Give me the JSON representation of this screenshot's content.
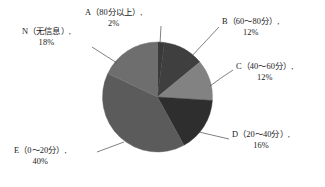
{
  "chart_data": {
    "type": "pie",
    "title": "",
    "subtitle": "",
    "xlabel": "",
    "ylabel": "",
    "legend_position": "none",
    "grid": false,
    "labels_outside": true,
    "leader_lines": true,
    "categories": [
      "A（80分以上）",
      "B（60～80分）",
      "C（40～60分）",
      "D（20～40分）",
      "E（0～20分）",
      "N（无信息）"
    ],
    "values": [
      2,
      12,
      12,
      16,
      40,
      18
    ],
    "value_unit": "%",
    "slices": [
      {
        "key": "A",
        "category": "A（80分以上）",
        "percent_text": "2%",
        "value": 2,
        "color": "#3a3a3a",
        "start_angle_deg": 0,
        "end_angle_deg": 7.2
      },
      {
        "key": "B",
        "category": "B（60～80分）",
        "percent_text": "12%",
        "value": 12,
        "color": "#3f3f3f",
        "start_angle_deg": 7.2,
        "end_angle_deg": 50.4
      },
      {
        "key": "C",
        "category": "C（40～60分）",
        "percent_text": "12%",
        "value": 12,
        "color": "#828282",
        "start_angle_deg": 50.4,
        "end_angle_deg": 93.6
      },
      {
        "key": "D",
        "category": "D（20～40分）",
        "percent_text": "16%",
        "value": 16,
        "color": "#2e2e2e",
        "start_angle_deg": 93.6,
        "end_angle_deg": 151.2
      },
      {
        "key": "E",
        "category": "E（0～20分）",
        "percent_text": "40%",
        "value": 40,
        "color": "#5b5b5b",
        "start_angle_deg": 151.2,
        "end_angle_deg": 295.2
      },
      {
        "key": "N",
        "category": "N（无信息）",
        "percent_text": "18%",
        "value": 18,
        "color": "#6e6e6e",
        "start_angle_deg": 295.2,
        "end_angle_deg": 360
      }
    ],
    "colors": {
      "A": "#3a3a3a",
      "B": "#3f3f3f",
      "C": "#828282",
      "D": "#2e2e2e",
      "E": "#5b5b5b",
      "N": "#6e6e6e",
      "background": "#ffffff",
      "text": "#1c1c1c",
      "leader_line": "#4a4a4a"
    }
  },
  "labels": {
    "a": {
      "name": "A（80分以上）,",
      "percent": "2%"
    },
    "b": {
      "name": "B（60～80分）,",
      "percent": "12%"
    },
    "c": {
      "name": "C（40～60分）,",
      "percent": "12%"
    },
    "d": {
      "name": "D（20～40分）,",
      "percent": "16%"
    },
    "e": {
      "name": "E（0～20分）,",
      "percent": "40%"
    },
    "n": {
      "name": "N（无信息）,",
      "percent": "18%"
    }
  }
}
